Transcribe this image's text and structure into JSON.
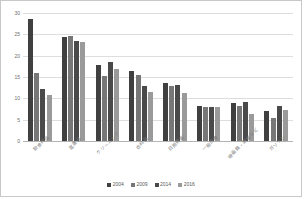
{
  "chart_data": {
    "type": "bar",
    "title": "",
    "xlabel": "",
    "ylabel": "",
    "ylim": [
      0,
      30
    ],
    "yticks": [
      0,
      5,
      10,
      15,
      20,
      25,
      30
    ],
    "grid": true,
    "legend_position": "bottom",
    "categories": [
      "飲食料品",
      "医薬品",
      "クリーニング",
      "衣料品",
      "日用雑貨",
      "一般診療",
      "映画館・劇場など",
      "ガソリン"
    ],
    "series": [
      {
        "name": "2004",
        "color": "#404040",
        "values": [
          28.5,
          24.3,
          17.8,
          16.3,
          13.5,
          8.1,
          9.0,
          7.1
        ]
      },
      {
        "name": "2009",
        "color": "#777777",
        "values": [
          16.0,
          24.7,
          15.2,
          15.5,
          13.0,
          8.0,
          8.2,
          5.5
        ]
      },
      {
        "name": "2014",
        "color": "#4a4a4a",
        "values": [
          12.2,
          23.4,
          18.6,
          13.0,
          13.2,
          8.0,
          9.2,
          8.1
        ]
      },
      {
        "name": "2016",
        "color": "#9a9a9a",
        "values": [
          10.8,
          23.3,
          16.8,
          11.5,
          11.2,
          7.9,
          6.3,
          7.2
        ]
      }
    ]
  },
  "axis": {
    "y_tick_labels": [
      "30",
      "25",
      "20",
      "15",
      "10",
      "5",
      "0"
    ]
  },
  "legend": {
    "items": [
      {
        "label": "2004",
        "color": "#404040"
      },
      {
        "label": "2009",
        "color": "#777777"
      },
      {
        "label": "2014",
        "color": "#4a4a4a"
      },
      {
        "label": "2016",
        "color": "#9a9a9a"
      }
    ]
  }
}
